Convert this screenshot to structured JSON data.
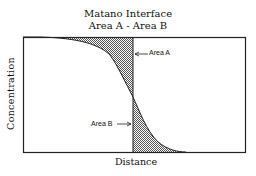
{
  "title": {
    "line1": "Matano Interface",
    "line2": "Area A - Area B"
  },
  "axes": {
    "xlabel": "Distance",
    "ylabel": "Concentration"
  },
  "annotations": {
    "area_a": "Area A",
    "area_b": "Area B"
  },
  "colors": {
    "line": "#222222",
    "shade": "#888888",
    "background": "#ffffff"
  }
}
